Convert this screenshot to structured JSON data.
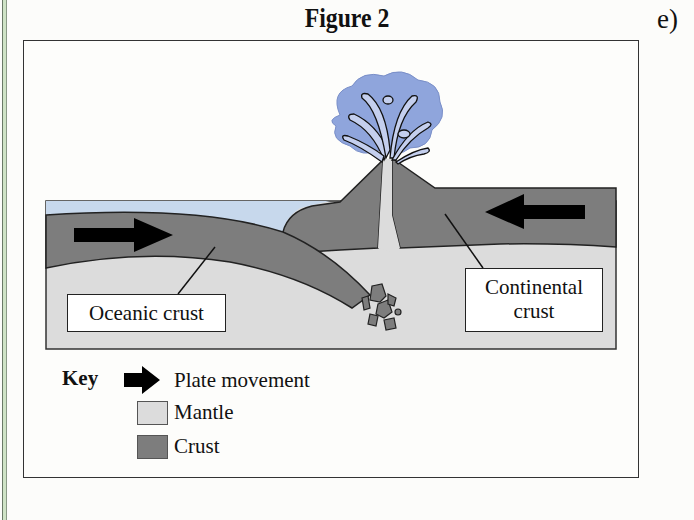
{
  "figure": {
    "title": "Figure 2",
    "part_label": "e)"
  },
  "diagram": {
    "labels": {
      "oceanic": "Oceanic crust",
      "continental_line1": "Continental",
      "continental_line2": "crust"
    },
    "elements": [
      "volcano",
      "eruption-plume",
      "ocean-water",
      "oceanic-plate",
      "continental-plate",
      "mantle",
      "subduction-melt-fragments"
    ],
    "arrows": [
      {
        "name": "oceanic-plate-movement",
        "direction": "right"
      },
      {
        "name": "continental-plate-movement",
        "direction": "left"
      }
    ]
  },
  "key": {
    "title": "Key",
    "items": [
      {
        "symbol": "arrow",
        "label": "Plate movement"
      },
      {
        "symbol": "swatch",
        "label": "Mantle",
        "color": "#dcdcdc"
      },
      {
        "symbol": "swatch",
        "label": "Crust",
        "color": "#7d7d7d"
      }
    ]
  },
  "colors": {
    "crust": "#7d7d7d",
    "mantle": "#dcdcdc",
    "ocean": "#c7d8ec",
    "plume": "#8fa5dc",
    "plume_highlight": "#c4cfee"
  }
}
